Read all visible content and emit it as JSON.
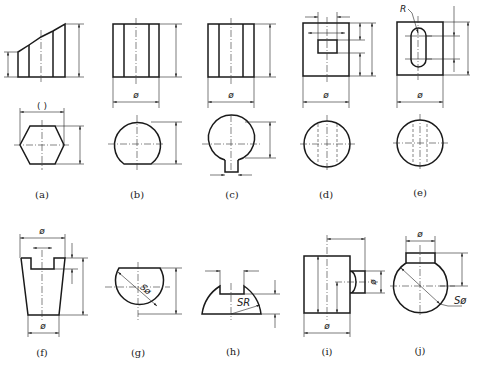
{
  "figure": {
    "labels": [
      "(a)",
      "(b)",
      "(c)",
      "(d)",
      "(e)",
      "(f)",
      "(g)",
      "(h)",
      "(i)",
      "(j)"
    ],
    "dimension_texts": {
      "a_width": "( )",
      "b_diameter": "ø",
      "c_diameter": "ø",
      "d_diameter": "ø",
      "e_radius": "R",
      "e_diameter": "ø",
      "f_top_diameter": "ø",
      "f_bottom_diameter": "ø",
      "g_sphere": "Sø",
      "h_sphere_radius": "SR",
      "i_diameter": "ø",
      "i_side_diameter": "ø",
      "j_top_diameter": "ø",
      "j_sphere": "Sø"
    },
    "colors": {
      "line": "#1a1a1a",
      "background": "#ffffff"
    }
  }
}
